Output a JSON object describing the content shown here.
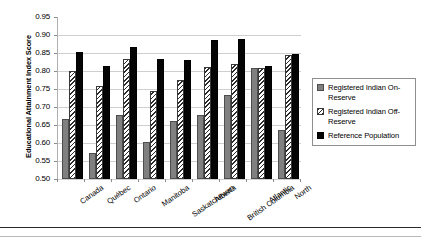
{
  "chart_data": {
    "type": "bar",
    "title": "",
    "xlabel": "",
    "ylabel": "Educational Attainment Index Score",
    "ylim": [
      0.5,
      0.95
    ],
    "ytick_step": 0.05,
    "yticks": [
      "0.95",
      "0.90",
      "0.85",
      "0.80",
      "0.75",
      "0.70",
      "0.65",
      "0.60",
      "0.55",
      "0.50"
    ],
    "ytick_values": [
      0.95,
      0.9,
      0.85,
      0.8,
      0.75,
      0.7,
      0.65,
      0.6,
      0.55,
      0.5
    ],
    "grid": true,
    "grid_axis": "y",
    "legend_position": "right",
    "categories": [
      "Canada",
      "Québec",
      "Ontario",
      "Manitoba",
      "Saskatchewan",
      "Alberta",
      "British Columbia",
      "Atlantic",
      "North"
    ],
    "series": [
      {
        "name": "Registered Indian On-Reserve",
        "color": "#808080",
        "pattern": "solid-gray",
        "values": [
          0.667,
          0.572,
          0.677,
          0.603,
          0.662,
          0.677,
          0.733,
          0.808,
          0.637
        ]
      },
      {
        "name": "Registered Indian Off-Reserve",
        "color": "#d8d8d8",
        "pattern": "diagonal-hatch",
        "values": [
          0.801,
          0.757,
          0.832,
          0.745,
          0.776,
          0.812,
          0.819,
          0.808,
          0.845
        ]
      },
      {
        "name": "Reference Population",
        "color": "#050505",
        "pattern": "solid-black",
        "values": [
          0.852,
          0.814,
          0.868,
          0.833,
          0.83,
          0.886,
          0.889,
          0.814,
          0.847
        ]
      }
    ]
  },
  "legend": {
    "items": [
      {
        "label": "Registered Indian On-Reserve",
        "swatch": "series0"
      },
      {
        "label": "Registered Indian Off-Reserve",
        "swatch": "series1"
      },
      {
        "label": "Reference Population",
        "swatch": "series2"
      }
    ]
  }
}
